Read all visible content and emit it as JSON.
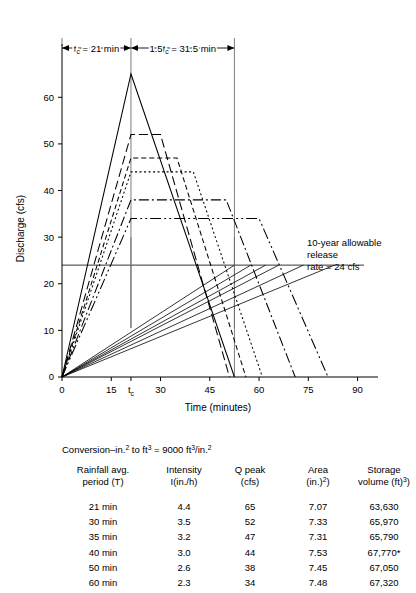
{
  "figure": {
    "axes": {
      "x": {
        "label": "Time (minutes)",
        "min": 0,
        "max": 95,
        "ticks": [
          0,
          15,
          30,
          45,
          60,
          75,
          90
        ],
        "tick_labels": [
          "0",
          "15",
          "30",
          "45",
          "60",
          "75",
          "90"
        ],
        "special_tick": {
          "value": 21,
          "label": "t",
          "sub": "c"
        }
      },
      "y": {
        "label": "Discharge (cfs)",
        "min": 0,
        "max": 68,
        "ticks": [
          0,
          10,
          20,
          30,
          40,
          50,
          60
        ],
        "tick_labels": [
          "0",
          "10",
          "20",
          "30",
          "40",
          "50",
          "60"
        ]
      }
    },
    "dimensions": [
      {
        "name": "tc",
        "text_pre": "t",
        "text_sub": "c",
        "text_post": " = 21 min",
        "x_start": 0,
        "x_end": 21
      },
      {
        "name": "1.5tc",
        "text_pre": "1.5t",
        "text_sub": "c",
        "text_post": " = 31.5 min",
        "x_start": 21,
        "x_end": 52.5
      }
    ],
    "annotation": {
      "line1": "10-year allowable",
      "line2": "release",
      "line3": "rate = 24 cfs",
      "release_rate": 24
    },
    "reference_lines": {
      "allowable_release_cfs": 24,
      "verticals": [
        {
          "x": 21,
          "y_top": 65,
          "y_bottom": 0
        },
        {
          "x": 52.5,
          "y_top": 38,
          "y_bottom": 0
        },
        {
          "x": 21,
          "y_top": 30,
          "y_bottom": 0
        }
      ]
    }
  },
  "chart_data": {
    "type": "line",
    "title": "",
    "xlabel": "Time (minutes)",
    "ylabel": "Discharge (cfs)",
    "xlim": [
      0,
      95
    ],
    "ylim": [
      0,
      68
    ],
    "grid": false,
    "legend": "none",
    "note": "Rational-method trapezoidal hydrographs; rising limb duration = tc = 21 min for all storms; plateau length = T - tc; recession duration = tc.",
    "tc_min": 21,
    "allowable_release_cfs": 24,
    "series": [
      {
        "name": "21 min",
        "peak_cfs": 65,
        "duration_min": 21,
        "dash": "none",
        "x": [
          0,
          21,
          52.5
        ],
        "y": [
          0,
          65,
          0
        ]
      },
      {
        "name": "30 min",
        "peak_cfs": 52,
        "duration_min": 30,
        "dash": "9,4",
        "x": [
          0,
          21,
          30,
          51
        ],
        "y": [
          0,
          52,
          52,
          0
        ]
      },
      {
        "name": "35 min",
        "peak_cfs": 47,
        "duration_min": 35,
        "dash": "5,3",
        "x": [
          0,
          21,
          35,
          56
        ],
        "y": [
          0,
          47,
          47,
          0
        ]
      },
      {
        "name": "40 min",
        "peak_cfs": 44,
        "duration_min": 40,
        "dash": "2,2.5",
        "x": [
          0,
          21,
          40,
          61
        ],
        "y": [
          0,
          44,
          44,
          0
        ]
      },
      {
        "name": "50 min",
        "peak_cfs": 38,
        "duration_min": 50,
        "dash": "10,3,2,3",
        "x": [
          0,
          21,
          50,
          71
        ],
        "y": [
          0,
          38,
          38,
          0
        ]
      },
      {
        "name": "60 min",
        "peak_cfs": 34,
        "duration_min": 60,
        "dash": "11,3,2,3,2,3",
        "x": [
          0,
          21,
          60,
          81
        ],
        "y": [
          0,
          34,
          34,
          0
        ]
      }
    ],
    "release_lines": [
      {
        "name": "21 min",
        "x": [
          0,
          52.5
        ],
        "y": [
          0,
          24
        ]
      },
      {
        "name": "30 min",
        "x": [
          0,
          57.5
        ],
        "y": [
          0,
          24
        ]
      },
      {
        "name": "35 min",
        "x": [
          0,
          62.0
        ],
        "y": [
          0,
          24
        ]
      },
      {
        "name": "40 min",
        "x": [
          0,
          66.0
        ],
        "y": [
          0,
          24
        ]
      },
      {
        "name": "50 min",
        "x": [
          0,
          73.5
        ],
        "y": [
          0,
          24
        ]
      },
      {
        "name": "60 min",
        "x": [
          0,
          83.0
        ],
        "y": [
          0,
          24
        ]
      }
    ]
  },
  "conversion_note": {
    "pre": "Conversion",
    "text": "Conversion–in.² to ft³ = 9000 ft³/in.²",
    "value": "9000",
    "units": "ft³/in.²"
  },
  "table": {
    "headers": [
      {
        "line1": "Rainfall avg.",
        "line2": "period (T)"
      },
      {
        "line1": "Intensity",
        "line2": "I(in./h)"
      },
      {
        "line1": "Q peak",
        "line2": "(cfs)"
      },
      {
        "line1": "Area",
        "line2": "(in.²)"
      },
      {
        "line1": "Storage",
        "line2": "volume (ft³)"
      }
    ],
    "rows": [
      {
        "period": "21 min",
        "intensity": "4.4",
        "qpeak": "65",
        "area": "7.07",
        "storage": "63,630"
      },
      {
        "period": "30 min",
        "intensity": "3.5",
        "qpeak": "52",
        "area": "7.33",
        "storage": "65,970"
      },
      {
        "period": "35 min",
        "intensity": "3.2",
        "qpeak": "47",
        "area": "7.31",
        "storage": "65,790"
      },
      {
        "period": "40 min",
        "intensity": "3.0",
        "qpeak": "44",
        "area": "7.53",
        "storage": "67,770*"
      },
      {
        "period": "50 min",
        "intensity": "2.6",
        "qpeak": "38",
        "area": "7.45",
        "storage": "67,050"
      },
      {
        "period": "60 min",
        "intensity": "2.3",
        "qpeak": "34",
        "area": "7.48",
        "storage": "67,320"
      }
    ]
  },
  "colors": {
    "ink": "#000000",
    "reference": "#6d6d6d",
    "background": "#ffffff"
  }
}
